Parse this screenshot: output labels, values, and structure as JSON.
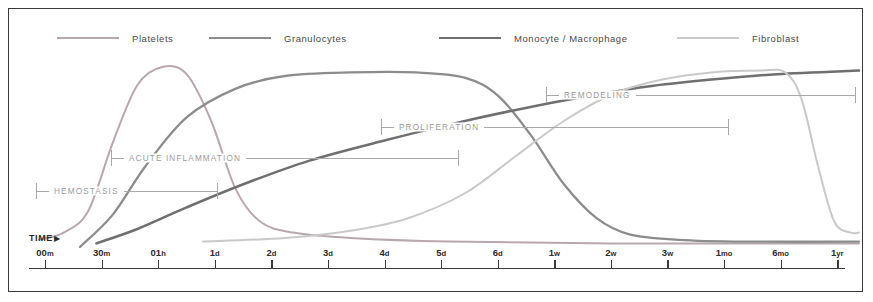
{
  "chart_data": {
    "type": "line",
    "title": "",
    "xlabel": "TIME",
    "ylabel": "",
    "grid": false,
    "legend_position": "top",
    "x_axis": {
      "scale": "log-ordinal",
      "tick_labels": [
        "00m",
        "30m",
        "01h",
        "1d",
        "2d",
        "3d",
        "4d",
        "5d",
        "6d",
        "1w",
        "2w",
        "3w",
        "1mo",
        "6mo",
        "1yr"
      ],
      "tick_values": [
        "00m",
        "30m",
        "01h",
        "1d",
        "2d",
        "3d",
        "4d",
        "5d",
        "6d",
        "1w",
        "2w",
        "3w",
        "1mo",
        "6mo",
        "1yr"
      ],
      "tick_numbers": [
        "00",
        "30",
        "01",
        "1",
        "2",
        "3",
        "4",
        "5",
        "6",
        "1",
        "2",
        "3",
        "1",
        "6",
        "1"
      ],
      "tick_units": [
        "m",
        "m",
        "h",
        "d",
        "d",
        "d",
        "d",
        "d",
        "d",
        "w",
        "w",
        "w",
        "mo",
        "mo",
        "yr"
      ]
    },
    "series": [
      {
        "name": "Platelets",
        "color": "#b8a8ad",
        "points": [
          [
            0,
            4
          ],
          [
            3,
            8
          ],
          [
            6,
            20
          ],
          [
            9,
            58
          ],
          [
            12,
            90
          ],
          [
            15,
            100
          ],
          [
            18,
            96
          ],
          [
            21,
            70
          ],
          [
            24,
            32
          ],
          [
            27,
            14
          ],
          [
            31,
            8
          ],
          [
            38,
            5
          ],
          [
            50,
            3
          ],
          [
            70,
            2
          ],
          [
            100,
            2
          ]
        ],
        "description": "Sharp early peak near 30m, rapid decay to near-zero baseline"
      },
      {
        "name": "Granulocytes",
        "color": "#8c8c8c",
        "points": [
          [
            5,
            0
          ],
          [
            9,
            18
          ],
          [
            13,
            45
          ],
          [
            18,
            72
          ],
          [
            24,
            88
          ],
          [
            30,
            95
          ],
          [
            38,
            97
          ],
          [
            46,
            97
          ],
          [
            52,
            94
          ],
          [
            56,
            84
          ],
          [
            60,
            62
          ],
          [
            64,
            35
          ],
          [
            68,
            16
          ],
          [
            72,
            7
          ],
          [
            78,
            4
          ],
          [
            86,
            3
          ],
          [
            100,
            3
          ]
        ],
        "description": "Rises from ~1h, plateaus 1d-3d, falls sharply by 4-5d"
      },
      {
        "name": "Monocyte / Macrophage",
        "color": "#6f6f6f",
        "points": [
          [
            7,
            2
          ],
          [
            12,
            10
          ],
          [
            18,
            22
          ],
          [
            25,
            35
          ],
          [
            33,
            48
          ],
          [
            42,
            59
          ],
          [
            50,
            68
          ],
          [
            58,
            76
          ],
          [
            66,
            83
          ],
          [
            74,
            89
          ],
          [
            82,
            93
          ],
          [
            90,
            96
          ],
          [
            100,
            98
          ]
        ],
        "description": "Steady near-linear rise across whole timeline, high plateau late"
      },
      {
        "name": "Fibroblast",
        "color": "#c9c9c9",
        "points": [
          [
            20,
            3
          ],
          [
            30,
            5
          ],
          [
            38,
            9
          ],
          [
            45,
            16
          ],
          [
            52,
            30
          ],
          [
            58,
            50
          ],
          [
            64,
            70
          ],
          [
            70,
            85
          ],
          [
            76,
            93
          ],
          [
            82,
            97
          ],
          [
            88,
            98
          ],
          [
            91,
            97
          ],
          [
            93,
            82
          ],
          [
            95,
            45
          ],
          [
            97,
            14
          ],
          [
            99,
            8
          ],
          [
            100,
            8
          ]
        ],
        "description": "Late rise from ~4d, high plateau through 1mo, steep drop near 6mo"
      }
    ],
    "phases": [
      {
        "label": "HEMOSTASIS",
        "start_tick": "00m",
        "end_tick": "1d"
      },
      {
        "label": "ACUTE INFLAMMATION",
        "start_tick": "30m",
        "end_tick": "5d"
      },
      {
        "label": "PROLIFERATION",
        "start_tick": "4d",
        "end_tick": "2w"
      },
      {
        "label": "REMODELING",
        "start_tick": "1w",
        "end_tick": "1yr"
      }
    ]
  },
  "legend": {
    "items": [
      {
        "label": "Platelets",
        "color": "#b8a8ad"
      },
      {
        "label": "Granulocytes",
        "color": "#8c8c8c"
      },
      {
        "label": "Monocyte / Macrophage",
        "color": "#6f6f6f"
      },
      {
        "label": "Fibroblast",
        "color": "#c9c9c9"
      }
    ]
  },
  "axis": {
    "time_label": "TIME",
    "arrow": "▶"
  }
}
